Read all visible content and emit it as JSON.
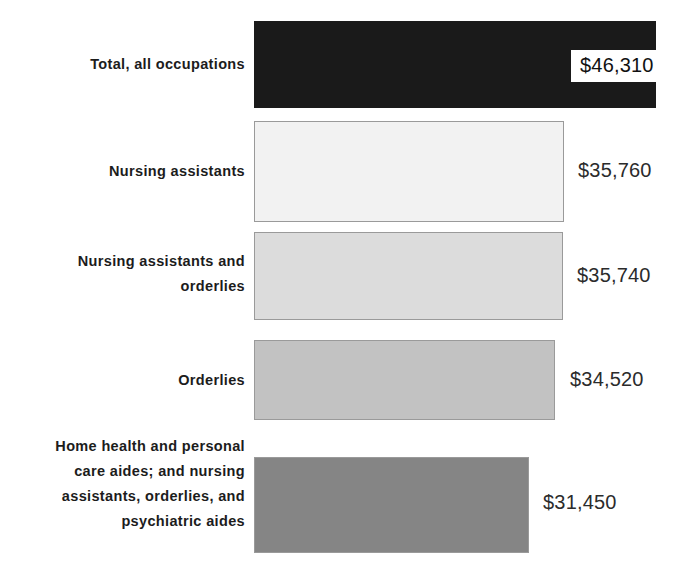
{
  "chart_data": {
    "type": "bar",
    "orientation": "horizontal",
    "title": "",
    "subtitle": "",
    "xlabel": "",
    "ylabel": "",
    "grid": false,
    "legend": null,
    "axis_visible": false,
    "xlim": [
      0,
      46310
    ],
    "categories": [
      "Total, all occupations",
      "Nursing assistants",
      "Nursing assistants and\norderlies",
      "Orderlies",
      "Home health and personal\ncare aides; and nursing\nassistants, orderlies, and\npsychiatric aides"
    ],
    "values": [
      46310,
      35760,
      35740,
      34520,
      31450
    ],
    "value_labels": [
      "$46,310",
      "$35,760",
      "$35,740",
      "$34,520",
      "$31,450"
    ],
    "bar_colors": [
      "#1a1a1a",
      "#f2f2f2",
      "#dcdcdc",
      "#c2c2c2",
      "#858585"
    ],
    "bar_border_colors": [
      null,
      "#9a9a9a",
      "#9a9a9a",
      "#9a9a9a",
      "#9a9a9a"
    ],
    "label_placement": [
      "inside-white-box",
      "outside",
      "outside",
      "outside",
      "outside"
    ]
  },
  "rows": [
    {
      "category": "Total, all occupations",
      "value_label": "$46,310"
    },
    {
      "category": "Nursing assistants",
      "value_label": "$35,760"
    },
    {
      "category": "Nursing assistants and\norderlies",
      "value_label": "$35,740"
    },
    {
      "category": "Orderlies",
      "value_label": "$34,520"
    },
    {
      "category": "Home health and personal\ncare aides; and nursing\nassistants, orderlies, and\npsychiatric aides",
      "value_label": "$31,450"
    }
  ]
}
